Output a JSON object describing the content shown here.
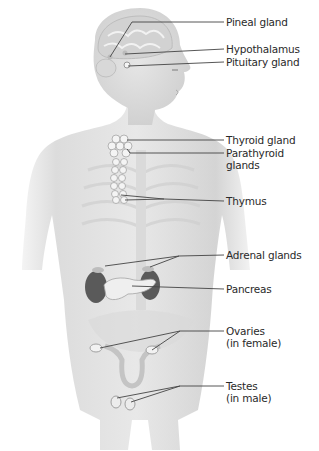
{
  "diagram": {
    "labels": [
      {
        "id": "pineal",
        "line1": "Pineal gland",
        "line2": "",
        "y": 22
      },
      {
        "id": "hypothalamus",
        "line1": "Hypothalamus",
        "line2": "",
        "y": 49
      },
      {
        "id": "pituitary",
        "line1": "Pituitary gland",
        "line2": "",
        "y": 62
      },
      {
        "id": "thyroid",
        "line1": "Thyroid gland",
        "line2": "",
        "y": 140
      },
      {
        "id": "parathyroid",
        "line1": "Parathyroid",
        "line2": "glands",
        "y": 153
      },
      {
        "id": "thymus",
        "line1": "Thymus",
        "line2": "",
        "y": 199
      },
      {
        "id": "adrenal",
        "line1": "Adrenal glands",
        "line2": "",
        "y": 254
      },
      {
        "id": "pancreas",
        "line1": "Pancreas",
        "line2": "",
        "y": 284
      },
      {
        "id": "ovaries",
        "line1": "Ovaries",
        "line2": "(in female)",
        "y": 331
      },
      {
        "id": "testes",
        "line1": "Testes",
        "line2": "(in male)",
        "y": 386
      }
    ],
    "colors": {
      "skin": "#e4e4e4",
      "skin_shade": "#c9c9c9",
      "brain": "#d6d6d6",
      "organ_dark": "#555555",
      "gland": "#f0f0f0",
      "leader_line": "#444444",
      "text": "#2a2a2a"
    }
  }
}
